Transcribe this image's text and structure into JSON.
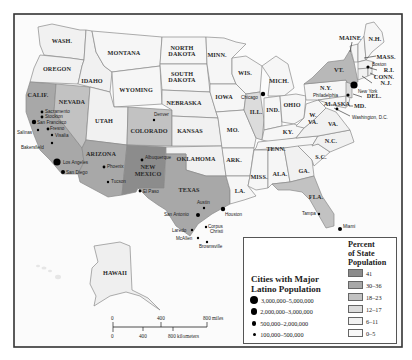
{
  "map": {
    "states": [
      {
        "id": "WA",
        "label": "WASH.",
        "pct": "6-11",
        "fill": "#f1f1f1"
      },
      {
        "id": "OR",
        "label": "OREGON",
        "pct": "6-11",
        "fill": "#f1f1f1"
      },
      {
        "id": "CA",
        "label": "CALIF.",
        "pct": "30-36",
        "fill": "#a8a8a8"
      },
      {
        "id": "NV",
        "label": "NEVADA",
        "pct": "18-23",
        "fill": "#c2c2c2"
      },
      {
        "id": "ID",
        "label": "IDAHO",
        "pct": "6-11",
        "fill": "#f1f1f1"
      },
      {
        "id": "MT",
        "label": "MONTANA",
        "pct": "0-5",
        "fill": "#f6f6f6"
      },
      {
        "id": "WY",
        "label": "WYOMING",
        "pct": "6-11",
        "fill": "#f1f1f1"
      },
      {
        "id": "UT",
        "label": "UTAH",
        "pct": "6-11",
        "fill": "#f1f1f1"
      },
      {
        "id": "AZ",
        "label": "ARIZONA",
        "pct": "30-36",
        "fill": "#a8a8a8"
      },
      {
        "id": "CO",
        "label": "COLORADO",
        "pct": "18-23",
        "fill": "#c2c2c2"
      },
      {
        "id": "NM",
        "label": "NEW MEXICO",
        "pct": "41",
        "fill": "#8c8c8c"
      },
      {
        "id": "ND",
        "label": "NORTH DAKOTA",
        "pct": "0-5",
        "fill": "#f6f6f6"
      },
      {
        "id": "SD",
        "label": "SOUTH DAKOTA",
        "pct": "0-5",
        "fill": "#f6f6f6"
      },
      {
        "id": "NE",
        "label": "NEBRASKA",
        "pct": "6-11",
        "fill": "#f1f1f1"
      },
      {
        "id": "KS",
        "label": "KANSAS",
        "pct": "6-11",
        "fill": "#f1f1f1"
      },
      {
        "id": "OK",
        "label": "OKLAHOMA",
        "pct": "6-11",
        "fill": "#f1f1f1"
      },
      {
        "id": "TX",
        "label": "TEXAS",
        "pct": "30-36",
        "fill": "#a8a8a8"
      },
      {
        "id": "MN",
        "label": "MINN.",
        "pct": "0-5",
        "fill": "#f6f6f6"
      },
      {
        "id": "IA",
        "label": "IOWA",
        "pct": "0-5",
        "fill": "#f6f6f6"
      },
      {
        "id": "MO",
        "label": "MO.",
        "pct": "0-5",
        "fill": "#f6f6f6"
      },
      {
        "id": "AR",
        "label": "ARK.",
        "pct": "0-5",
        "fill": "#f6f6f6"
      },
      {
        "id": "LA",
        "label": "LA.",
        "pct": "0-5",
        "fill": "#f6f6f6"
      },
      {
        "id": "WI",
        "label": "WIS.",
        "pct": "0-5",
        "fill": "#f6f6f6"
      },
      {
        "id": "IL",
        "label": "ILL.",
        "pct": "12-17",
        "fill": "#dcdcdc"
      },
      {
        "id": "MI",
        "label": "MICH.",
        "pct": "0-5",
        "fill": "#f6f6f6"
      },
      {
        "id": "IN",
        "label": "IND.",
        "pct": "0-5",
        "fill": "#f6f6f6"
      },
      {
        "id": "OH",
        "label": "OHIO",
        "pct": "0-5",
        "fill": "#f6f6f6"
      },
      {
        "id": "KY",
        "label": "KY.",
        "pct": "0-5",
        "fill": "#f6f6f6"
      },
      {
        "id": "TN",
        "label": "TENN.",
        "pct": "0-5",
        "fill": "#f6f6f6"
      },
      {
        "id": "MS",
        "label": "MISS.",
        "pct": "0-5",
        "fill": "#f6f6f6"
      },
      {
        "id": "AL",
        "label": "ALA.",
        "pct": "0-5",
        "fill": "#f6f6f6"
      },
      {
        "id": "GA",
        "label": "GA.",
        "pct": "6-11",
        "fill": "#f1f1f1"
      },
      {
        "id": "FL",
        "label": "FLA.",
        "pct": "18-23",
        "fill": "#c2c2c2"
      },
      {
        "id": "SC",
        "label": "S.C.",
        "pct": "0-5",
        "fill": "#f6f6f6"
      },
      {
        "id": "NC",
        "label": "N.C.",
        "pct": "6-11",
        "fill": "#f1f1f1"
      },
      {
        "id": "VA",
        "label": "VA.",
        "pct": "6-11",
        "fill": "#f1f1f1"
      },
      {
        "id": "WV",
        "label": "W. VA.",
        "pct": "0-5",
        "fill": "#f6f6f6"
      },
      {
        "id": "PA",
        "label": "PA.",
        "pct": "0-5",
        "fill": "#f6f6f6"
      },
      {
        "id": "NY",
        "label": "N.Y.",
        "pct": "12-17",
        "fill": "#b8b8b8"
      },
      {
        "id": "VT",
        "label": "VT.",
        "pct": "0-5",
        "fill": "#f6f6f6"
      },
      {
        "id": "ME",
        "label": "MAINE",
        "pct": "0-5",
        "fill": "#f6f6f6"
      },
      {
        "id": "NH",
        "label": "N.H.",
        "pct": "0-5",
        "fill": "#f6f6f6"
      },
      {
        "id": "MA",
        "label": "MASS.",
        "pct": "6-11",
        "fill": "#f1f1f1"
      },
      {
        "id": "RI",
        "label": "R.I.",
        "pct": "6-11",
        "fill": "#f1f1f1"
      },
      {
        "id": "CT",
        "label": "CONN.",
        "pct": "6-11",
        "fill": "#f1f1f1"
      },
      {
        "id": "NJ",
        "label": "N.J.",
        "pct": "12-17",
        "fill": "#dcdcdc"
      },
      {
        "id": "DE",
        "label": "DEL.",
        "pct": "0-5",
        "fill": "#f6f6f6"
      },
      {
        "id": "MD",
        "label": "MD.",
        "pct": "0-5",
        "fill": "#f6f6f6"
      },
      {
        "id": "AK",
        "label": "ALASKA",
        "pct": "0-5",
        "fill": "#efefef"
      },
      {
        "id": "HI",
        "label": "HAWAII",
        "pct": "6-11",
        "fill": "#efefef"
      }
    ],
    "cities": [
      {
        "name": "Sacramento"
      },
      {
        "name": "Stockton"
      },
      {
        "name": "San Francisco"
      },
      {
        "name": "Salinas"
      },
      {
        "name": "Fresno"
      },
      {
        "name": "Visalia"
      },
      {
        "name": "Bakersfield"
      },
      {
        "name": "Los Angeles"
      },
      {
        "name": "San Diego"
      },
      {
        "name": "Phoenix"
      },
      {
        "name": "Tucson"
      },
      {
        "name": "Albuquerque"
      },
      {
        "name": "El Paso"
      },
      {
        "name": "Denver"
      },
      {
        "name": "Austin"
      },
      {
        "name": "San Antonio"
      },
      {
        "name": "Houston"
      },
      {
        "name": "Laredo"
      },
      {
        "name": "Corpus Christi"
      },
      {
        "name": "McAllen"
      },
      {
        "name": "Brownsville"
      },
      {
        "name": "Chicago"
      },
      {
        "name": "Tampa"
      },
      {
        "name": "Miami"
      },
      {
        "name": "Boston"
      },
      {
        "name": "New York"
      },
      {
        "name": "Philadelphia"
      },
      {
        "name": "Washington, D.C."
      }
    ],
    "scale_bar": {
      "miles": [
        "0",
        "400",
        "800 miles"
      ],
      "kilometers": [
        "0",
        "400",
        "800 kilometers"
      ]
    }
  },
  "legend": {
    "cities_title_line1": "Cities with Major",
    "cities_title_line2": "Latino Population",
    "sizes": [
      {
        "label": "3,000,000–5,000,000"
      },
      {
        "label": "2,000,000–3,000,000"
      },
      {
        "label": "500,000–2,000,000"
      },
      {
        "label": "100,000–500,000"
      }
    ],
    "percent_title_line1": "Percent",
    "percent_title_line2": "of State",
    "percent_title_line3": "Population",
    "classes": [
      {
        "label": "41",
        "color": "#8c8c8c"
      },
      {
        "label": "30–36",
        "color": "#a8a8a8"
      },
      {
        "label": "18–23",
        "color": "#c2c2c2"
      },
      {
        "label": "12–17",
        "color": "#dcdcdc"
      },
      {
        "label": "6–11",
        "color": "#f1f1f1"
      },
      {
        "label": "0–5",
        "color": "#f8f8f8"
      }
    ]
  }
}
